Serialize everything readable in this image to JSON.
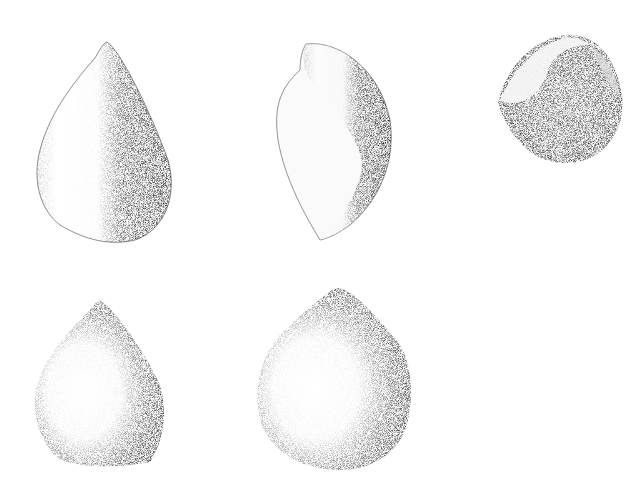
{
  "plate": {
    "background": "#ffffff",
    "ink": "#111111",
    "specimens": [
      {
        "id": 1,
        "view": "front",
        "row": 1,
        "col": 1
      },
      {
        "id": 2,
        "view": "side",
        "row": 1,
        "col": 2
      },
      {
        "id": 3,
        "view": "apertural-top",
        "row": 1,
        "col": 3
      },
      {
        "id": 4,
        "view": "front",
        "row": 2,
        "col": 1
      },
      {
        "id": 5,
        "view": "front",
        "row": 2,
        "col": 2
      }
    ]
  }
}
